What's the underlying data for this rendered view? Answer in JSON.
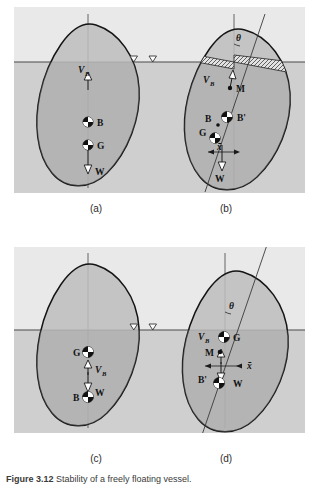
{
  "figure": {
    "caption_label": "Figure  3.12",
    "caption_text": "Stability of a freely floating vessel.",
    "background_color": "#e8e8e8",
    "water_color": "#c9c9c9",
    "hull_fill_color": "#b9b9b9",
    "outline_color": "#1a1a1a",
    "text_color": "#121212"
  },
  "panels": [
    {
      "id": "a",
      "label": "(a)",
      "description": "Upright stable vessel, B above G",
      "annotations": [
        {
          "name": "buoyancy-force",
          "text": "V",
          "sub": "B"
        },
        {
          "name": "center-of-buoyancy",
          "text": "B"
        },
        {
          "name": "center-of-gravity",
          "text": "G"
        },
        {
          "name": "weight-force",
          "text": "W"
        }
      ],
      "waterline_symbol": "▽"
    },
    {
      "id": "b",
      "label": "(b)",
      "description": "Heeled vessel, metacenter M above G, righting arm x-bar",
      "annotations": [
        {
          "name": "heel-angle",
          "text": "θ"
        },
        {
          "name": "buoyancy-force",
          "text": "V",
          "sub": "B"
        },
        {
          "name": "metacenter",
          "text": "M"
        },
        {
          "name": "center-of-buoyancy",
          "text": "B"
        },
        {
          "name": "shifted-center-of-buoyancy",
          "text": "B'"
        },
        {
          "name": "center-of-gravity",
          "text": "G"
        },
        {
          "name": "righting-arm",
          "text": "x̄"
        },
        {
          "name": "weight-force",
          "text": "W"
        }
      ],
      "waterline_symbol": "▽"
    },
    {
      "id": "c",
      "label": "(c)",
      "description": "Upright unstable vessel, G above B",
      "annotations": [
        {
          "name": "center-of-gravity",
          "text": "G"
        },
        {
          "name": "buoyancy-force",
          "text": "V",
          "sub": "B"
        },
        {
          "name": "weight-force",
          "text": "W"
        },
        {
          "name": "center-of-buoyancy",
          "text": "B"
        }
      ],
      "waterline_symbol": "▽"
    },
    {
      "id": "d",
      "label": "(d)",
      "description": "Heeled unstable vessel, metacenter M below G, overturning arm x-bar",
      "annotations": [
        {
          "name": "heel-angle",
          "text": "θ"
        },
        {
          "name": "buoyancy-force",
          "text": "V",
          "sub": "B"
        },
        {
          "name": "center-of-gravity",
          "text": "G"
        },
        {
          "name": "metacenter",
          "text": "M"
        },
        {
          "name": "overturning-arm",
          "text": "x̄"
        },
        {
          "name": "shifted-center-of-buoyancy",
          "text": "B'"
        },
        {
          "name": "weight-force",
          "text": "W"
        }
      ],
      "waterline_symbol": "▽"
    }
  ]
}
